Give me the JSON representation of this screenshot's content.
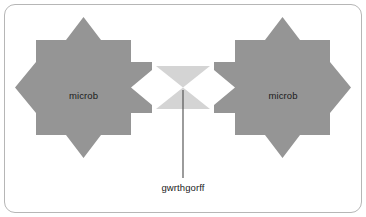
{
  "figure": {
    "background_color": "#ffffff",
    "border_color": "#b6b6b6"
  },
  "colors": {
    "microbe_fill": "#959595",
    "antibody_fill": "#d4d4d4",
    "leader_line": "#4a4a4a",
    "text": "#1b1b1b",
    "card_background": "#ffffff",
    "card_border": "#b6b6b6"
  },
  "shapes": {
    "microbe_left": {
      "label": "microb",
      "kind": "eight-pointed-star",
      "fill": "#959595"
    },
    "microbe_right": {
      "label": "microb",
      "kind": "eight-pointed-star",
      "fill": "#959595"
    },
    "antibody": {
      "label": "gwrthgorff",
      "kind": "bowtie",
      "fill": "#d4d4d4"
    }
  },
  "callout": {
    "caption": "gwrthgorff",
    "leader_line_color": "#4a4a4a"
  }
}
